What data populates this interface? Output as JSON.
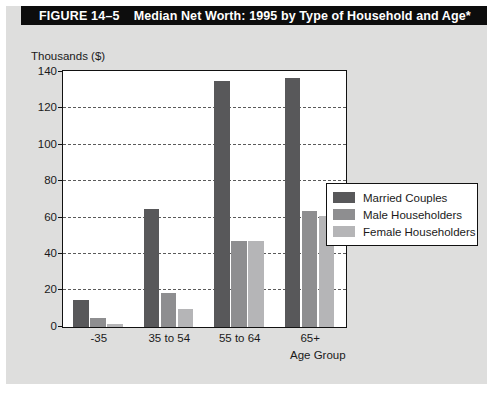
{
  "figure": {
    "number_label": "FIGURE 14–5",
    "title": "Median Net Worth: 1995 by Type of Household and Age*"
  },
  "chart_data": {
    "type": "bar",
    "title": "Median Net Worth: 1995 by Type of Household and Age*",
    "xlabel": "Age Group",
    "ylabel": "Thousands ($)",
    "categories": [
      "-35",
      "35 to 54",
      "55 to 64",
      "65+"
    ],
    "series": [
      {
        "name": "Married Couples",
        "color": "#58585a",
        "values": [
          15,
          65,
          135,
          137
        ]
      },
      {
        "name": "Male Householders",
        "color": "#8e8e90",
        "values": [
          5,
          18.5,
          47,
          64
        ]
      },
      {
        "name": "Female Householders",
        "color": "#b5b5b7",
        "values": [
          1.5,
          10,
          47.5,
          61
        ]
      }
    ],
    "ylim": [
      0,
      140
    ],
    "yticks": [
      0,
      20,
      40,
      60,
      80,
      100,
      120,
      140
    ],
    "ytick_labels": [
      "0",
      "20",
      "40",
      "60",
      "80",
      "100",
      "120",
      "140"
    ],
    "grid": true,
    "grid_style": "dashed-horizontal",
    "legend_position": "right-middle"
  },
  "colors": {
    "panel_background": "#dededd",
    "plot_background": "#ffffff",
    "title_bar_background": "#0d0d0d",
    "title_bar_text": "#ffffff",
    "axis_line": "#111111",
    "grid_line": "#5a5a5a",
    "text": "#1a1a1a"
  }
}
